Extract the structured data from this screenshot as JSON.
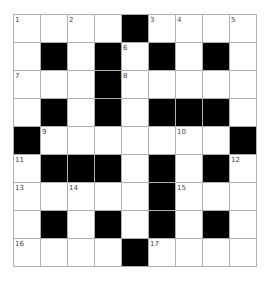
{
  "puzzle": {
    "rows": 9,
    "cols": 9,
    "colors": {
      "block": "#000000",
      "cell": "#ffffff",
      "gridline": "#b0b0b0",
      "number": "#444444"
    },
    "layout": [
      "....#....",
      ".#.#.#.#.",
      "...#.....",
      ".#.#.###.",
      "#.......#",
      ".###.#.#.",
      ".....#...",
      ".#.#.#.#.",
      "....#...."
    ],
    "numbers": [
      {
        "row": 0,
        "col": 0,
        "label": "1"
      },
      {
        "row": 0,
        "col": 2,
        "label": "2"
      },
      {
        "row": 0,
        "col": 5,
        "label": "3"
      },
      {
        "row": 0,
        "col": 6,
        "label": "4"
      },
      {
        "row": 0,
        "col": 8,
        "label": "5"
      },
      {
        "row": 1,
        "col": 4,
        "label": "6"
      },
      {
        "row": 2,
        "col": 0,
        "label": "7"
      },
      {
        "row": 2,
        "col": 4,
        "label": "8"
      },
      {
        "row": 4,
        "col": 1,
        "label": "9"
      },
      {
        "row": 4,
        "col": 6,
        "label": "10"
      },
      {
        "row": 5,
        "col": 0,
        "label": "11"
      },
      {
        "row": 5,
        "col": 8,
        "label": "12"
      },
      {
        "row": 6,
        "col": 0,
        "label": "13"
      },
      {
        "row": 6,
        "col": 2,
        "label": "14"
      },
      {
        "row": 6,
        "col": 6,
        "label": "15"
      },
      {
        "row": 8,
        "col": 0,
        "label": "16"
      },
      {
        "row": 8,
        "col": 5,
        "label": "17"
      }
    ],
    "entries": []
  }
}
